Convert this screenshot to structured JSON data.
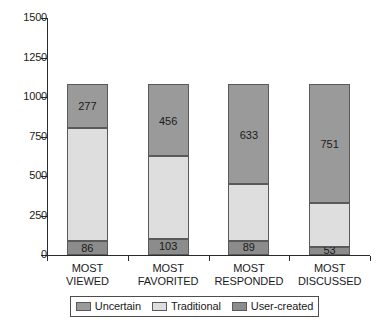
{
  "chart_data": {
    "type": "bar",
    "subtype": "stacked-vertical",
    "title": "",
    "xlabel": "",
    "ylabel": "",
    "ylim": [
      0,
      1500
    ],
    "yticks": [
      0,
      250,
      500,
      750,
      1000,
      1250,
      1500
    ],
    "ytick_labels": [
      "0",
      "250",
      "500",
      "750",
      "1000",
      "1250",
      "1500"
    ],
    "grid": false,
    "legend_position": "bottom",
    "categories": [
      "MOST VIEWED",
      "MOST FAVORITED",
      "MOST RESPONDED",
      "MOST DISCUSSED"
    ],
    "category_lines": [
      [
        "MOST",
        "VIEWED"
      ],
      [
        "MOST",
        "FAVORITED"
      ],
      [
        "MOST",
        "RESPONDED"
      ],
      [
        "MOST",
        "DISCUSSED"
      ]
    ],
    "series": [
      {
        "name": "User-created",
        "color": "#8c8c8c",
        "values": [
          86,
          103,
          89,
          53
        ],
        "labels": [
          "86",
          "103",
          "89",
          "53"
        ]
      },
      {
        "name": "Traditional",
        "color": "#dedede",
        "values": [
          719,
          523,
          360,
          278
        ],
        "labels": [
          "",
          "",
          "",
          ""
        ]
      },
      {
        "name": "Uncertain",
        "color": "#9a9a9a",
        "values": [
          277,
          456,
          633,
          751
        ],
        "labels": [
          "277",
          "456",
          "633",
          "751"
        ]
      }
    ],
    "totals": [
      1082,
      1082,
      1082,
      1082
    ],
    "legend": [
      {
        "label": "Uncertain",
        "color": "#9a9a9a"
      },
      {
        "label": "Traditional",
        "color": "#dedede"
      },
      {
        "label": "User-created",
        "color": "#8c8c8c"
      }
    ]
  }
}
